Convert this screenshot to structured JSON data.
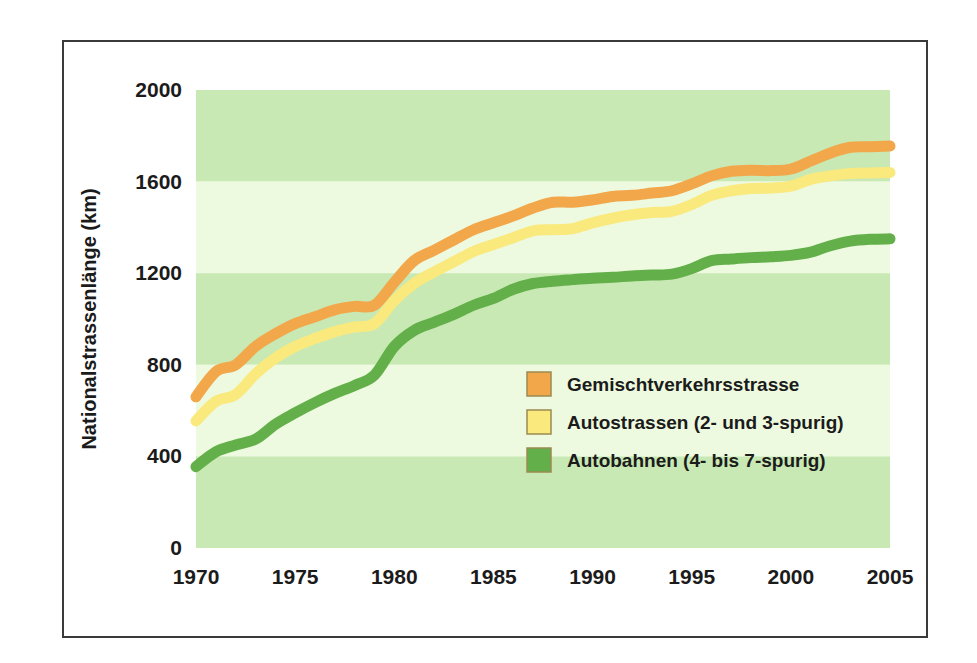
{
  "figure": {
    "background": "#ffffff",
    "frame_color": "#3a3a3a"
  },
  "axis": {
    "y_title": "Nationalstrassenlänge (km)",
    "y_ticks": [
      "0",
      "400",
      "800",
      "1200",
      "1600",
      "2000"
    ],
    "x_ticks": [
      "1970",
      "1975",
      "1980",
      "1985",
      "1990",
      "1995",
      "2000",
      "2005"
    ]
  },
  "legend": {
    "position": "inside-center-right",
    "entries": [
      {
        "label": "Gemischtverkehrsstrasse",
        "color": "#F2A74B"
      },
      {
        "label": "Autostrassen (2- und 3-spurig)",
        "color": "#FAE97C"
      },
      {
        "label": "Autobahnen (4- bis 7-spurig)",
        "color": "#63B04A"
      }
    ]
  },
  "bands": {
    "dark": "#C9E9B4",
    "light": "#EEFADF",
    "ranges": [
      {
        "from": 1600,
        "to": 2000,
        "shade": "dark"
      },
      {
        "from": 1200,
        "to": 1600,
        "shade": "light"
      },
      {
        "from": 800,
        "to": 1200,
        "shade": "dark"
      },
      {
        "from": 400,
        "to": 800,
        "shade": "light"
      },
      {
        "from": 0,
        "to": 400,
        "shade": "dark"
      }
    ]
  },
  "chart_data": {
    "type": "line",
    "title": "",
    "xlabel": "",
    "ylabel": "Nationalstrassenlänge (km)",
    "xlim": [
      1970,
      2005
    ],
    "ylim": [
      0,
      2000
    ],
    "grid": false,
    "legend_position": "inside-center-right",
    "x": [
      1970,
      1971,
      1972,
      1973,
      1974,
      1975,
      1976,
      1977,
      1978,
      1979,
      1980,
      1981,
      1982,
      1983,
      1984,
      1985,
      1986,
      1987,
      1988,
      1989,
      1990,
      1991,
      1992,
      1993,
      1994,
      1995,
      1996,
      1997,
      1998,
      1999,
      2000,
      2001,
      2002,
      2003,
      2004,
      2005
    ],
    "series": [
      {
        "name": "Gemischtverkehrsstrasse",
        "color": "#F2A74B",
        "values": [
          660,
          770,
          800,
          880,
          935,
          980,
          1010,
          1040,
          1055,
          1060,
          1160,
          1255,
          1300,
          1345,
          1390,
          1420,
          1450,
          1485,
          1510,
          1510,
          1520,
          1535,
          1540,
          1550,
          1560,
          1590,
          1625,
          1645,
          1650,
          1648,
          1655,
          1690,
          1725,
          1750,
          1752,
          1755
        ]
      },
      {
        "name": "Autostrassen (2- und 3-spurig)",
        "color": "#FAE97C",
        "values": [
          555,
          640,
          670,
          760,
          830,
          880,
          915,
          945,
          965,
          980,
          1080,
          1155,
          1205,
          1250,
          1295,
          1325,
          1355,
          1385,
          1390,
          1395,
          1420,
          1440,
          1455,
          1465,
          1470,
          1500,
          1540,
          1560,
          1570,
          1572,
          1580,
          1610,
          1625,
          1635,
          1638,
          1640
        ]
      },
      {
        "name": "Autobahnen (4- bis 7-spurig)",
        "color": "#63B04A",
        "values": [
          355,
          420,
          450,
          475,
          540,
          590,
          635,
          675,
          710,
          755,
          880,
          950,
          985,
          1020,
          1060,
          1090,
          1130,
          1155,
          1165,
          1172,
          1178,
          1182,
          1188,
          1192,
          1196,
          1220,
          1255,
          1262,
          1268,
          1272,
          1278,
          1292,
          1320,
          1340,
          1348,
          1350
        ]
      }
    ]
  }
}
